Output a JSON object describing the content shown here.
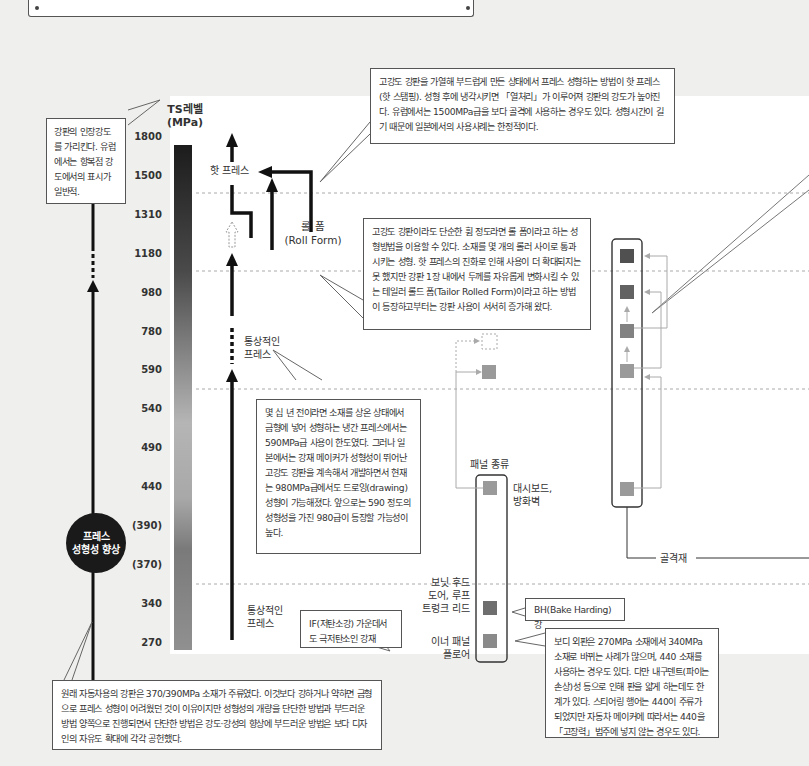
{
  "scale": {
    "title_line1": "TS레벨",
    "title_line2": "(MPa)",
    "ticks": [
      "1800",
      "1500",
      "1310",
      "1180",
      "980",
      "780",
      "590",
      "540",
      "490",
      "440",
      "(390)",
      "(370)",
      "340",
      "270"
    ]
  },
  "callouts": {
    "ts_note": "강판의 인장강도를 가리킨다. 유럽에서는 항복점 강도에서의 표시가 일반적.",
    "hot_press": "고강도 강판을 가열해 부드럽게 만든 상태에서 프레스 성형하는 방법이 핫 프레스(핫 스탬핑). 성형 후에 냉각시키면 「열처리」가 이루어져 강판의 강도가 높아진다. 유럽에서는 1500MPa급을 보다 골격에 사용하는 경우도 있다. 성형시간이 길기 때문에 일본에서의 사용사례는 한정적이다.",
    "roll_form": "고강도 강판이라도 단순한 휨 정도라면 롤 폼이라고 하는 성형방법을 이용할 수 있다. 소재를 몇 개의 롤러 사이로 통과시키는 성형. 핫 프레스의 진화로 인해 사용이 더 확대되지는 못 했지만 강판 1장 내에서 두께를 자유롭게 변화시킬 수 있는 테일러 롤드 폼(Tailor Rolled Form)이라고 하는 방법이 등장하고부터는 강판 사용이 서서히 증가해 왔다.",
    "cold_press": "몇 십 년 전이라면 소재를 상온 상태에서 금형에 넣어 성형하는 냉간 프레스에서는 590MPa급 사용이 한도였다. 그러나 일본에서는 강재 메이커가 성형성이 뛰어난 고강도 강판을 계속해서 개발하면서 현재는 980MPa급에서도 드로잉(drawing) 성형이 가능해졌다. 앞으로는 590 정도의 성형성을 가진 980급이 등장할 가능성이 높다.",
    "if_steel": "IF(저탄소강) 가운데서도 극저탄소인 강재",
    "bh_steel": "BH(Bake Harding) 강",
    "body_outer": "보디 외판은 270MPa 소재에서 340MPa 소재로 바뀌는 사례가 많으며, 440 소재를 사용하는 경우도 있다. 다만 내구덴트(파이는 손상)성 등으로 인해 판을 얇게 하는데도 한계가 있다. 스티어링 행어는 440이 주류가 되었지만 자동차 메이커에 따라서는 440을 「고장력」범주에 넣지 않는 경우도 있다.",
    "history": "원래 자동차용의 강판은 370/390MPa 소재가 주류였다. 이것보다 강하거나 약하면 금형으로 프레스 성형이 어려웠던 것이 이유이지만 성형성의 개량을 단단한 방법과 부드러운 방법 양쪽으로 진행되면서 단단한 방법은 강도·강성의 향상에 부드러운 방법은 보다 디자인의 자유도 확대에 각각 공헌했다."
  },
  "labels": {
    "hot_press": "핫 프레스",
    "roll_form_line1": "롤 폼",
    "roll_form_line2": "(Roll Form)",
    "normal_press_upper_line1": "통상적인",
    "normal_press_upper_line2": "프레스",
    "normal_press_lower_line1": "통상적인",
    "normal_press_lower_line2": "프레스",
    "badge_line1": "프레스",
    "badge_line2": "성형성 향상",
    "panel_type": "패널 종류",
    "dashboard_line1": "대시보드,",
    "dashboard_line2": "방화벽",
    "hood_line1": "보닛 후드",
    "hood_line2": "도어, 루프",
    "hood_line3": "트렁크 리드",
    "inner_line1": "이너 패널",
    "inner_line2": "플로어",
    "frame": "골격재"
  },
  "colors": {
    "background": "#efefed",
    "panel": "#ffffff",
    "arrow": "#111111",
    "square_dark": "#5a5a5a",
    "square_mid": "#6e6e6e",
    "square_light": "#9a9a9a",
    "connector": "#aaaaaa"
  }
}
